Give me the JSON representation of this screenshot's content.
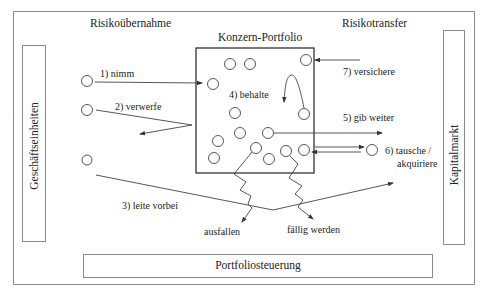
{
  "diagram": {
    "header_left": "Risikoübernahme",
    "header_right": "Risikotransfer",
    "portfolio_title": "Konzern-Portfolio",
    "left_box_label": "Geschäftseinheiten",
    "right_box_label": "Kapitalmarkt",
    "bottom_box_label": "Portfoliosteuerung",
    "actions": [
      {
        "id": "1",
        "label": "1) nimm"
      },
      {
        "id": "2",
        "label": "2) verwerfe"
      },
      {
        "id": "3",
        "label": "3) leite vorbei"
      },
      {
        "id": "4",
        "label": "4) behalte"
      },
      {
        "id": "5",
        "label": "5) gib weiter"
      },
      {
        "id": "6a",
        "label": "6) tausche /"
      },
      {
        "id": "6b",
        "label": "akquiriere"
      },
      {
        "id": "7",
        "label": "7) versichere"
      }
    ],
    "outcomes": {
      "default": "ausfallen",
      "maturity": "fällig werden"
    },
    "colors": {
      "line": "#444444",
      "frame": "#8a8a8a",
      "text": "#222222"
    }
  }
}
